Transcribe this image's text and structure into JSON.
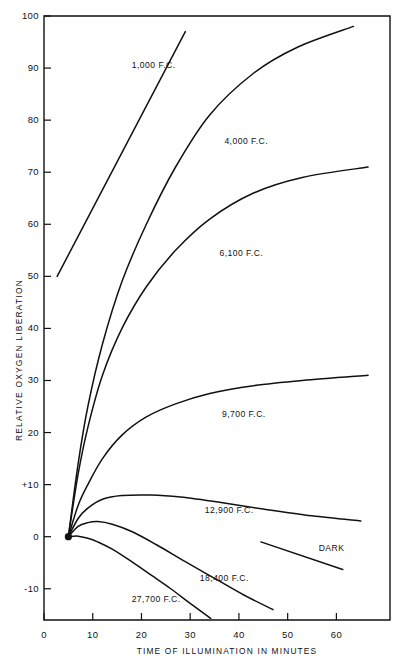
{
  "chart_data": {
    "type": "line",
    "title": "",
    "xlabel": "TIME OF ILLUMINATION IN MINUTES",
    "ylabel": "RELATIVE OXYGEN LIBERATION",
    "xlim": [
      0,
      71
    ],
    "ylim": [
      -16,
      100
    ],
    "grid": false,
    "legend": "inline-labels",
    "xticks": [
      0,
      10,
      20,
      30,
      40,
      50,
      60
    ],
    "xticklabels": [
      "0",
      "10",
      "20",
      "30",
      "40",
      "50",
      "60"
    ],
    "yticks": [
      -10,
      0,
      10,
      20,
      30,
      40,
      50,
      60,
      70,
      80,
      90,
      100
    ],
    "yticklabels": [
      "-10",
      "0",
      "+10",
      "20",
      "30",
      "40",
      "50",
      "60",
      "70",
      "80",
      "90",
      "100"
    ],
    "origin_marker": {
      "x": 5,
      "y": 0,
      "label": "origin-dot"
    },
    "series": [
      {
        "name": "1,000 F.C.",
        "label": "1,000 F.C.",
        "label_x": 22.5,
        "label_y": 90,
        "points": [
          [
            2.7,
            50
          ],
          [
            29.0,
            97
          ]
        ]
      },
      {
        "name": "4,000 F.C.",
        "label": "4,000 F.C.",
        "label_x": 41.5,
        "label_y": 75.5,
        "points": [
          [
            5,
            0
          ],
          [
            7,
            14
          ],
          [
            9,
            25
          ],
          [
            12,
            37
          ],
          [
            16,
            49
          ],
          [
            21,
            60
          ],
          [
            27,
            71
          ],
          [
            34,
            81
          ],
          [
            43,
            89
          ],
          [
            52,
            94
          ],
          [
            63.5,
            98
          ]
        ]
      },
      {
        "name": "6,100 F.C.",
        "label": "6,100 F.C.",
        "label_x": 40.5,
        "label_y": 54,
        "points": [
          [
            5,
            0
          ],
          [
            7,
            12
          ],
          [
            9,
            21
          ],
          [
            12,
            31
          ],
          [
            16,
            40
          ],
          [
            21,
            48
          ],
          [
            27,
            55
          ],
          [
            34,
            61
          ],
          [
            43,
            66
          ],
          [
            53,
            69
          ],
          [
            66.5,
            71
          ]
        ]
      },
      {
        "name": "9,700 F.C.",
        "label": "9,700 F.C.",
        "label_x": 41,
        "label_y": 23,
        "points": [
          [
            5,
            0
          ],
          [
            7,
            6
          ],
          [
            9,
            10
          ],
          [
            12,
            15
          ],
          [
            16,
            19.5
          ],
          [
            21,
            23
          ],
          [
            27,
            25.5
          ],
          [
            34,
            27.5
          ],
          [
            43,
            29
          ],
          [
            53,
            30
          ],
          [
            66.5,
            31
          ]
        ]
      },
      {
        "name": "12,900 F.C.",
        "label": "12,900 F.C.",
        "label_x": 38,
        "label_y": 4.5,
        "points": [
          [
            5,
            0
          ],
          [
            7,
            3.5
          ],
          [
            9,
            5.5
          ],
          [
            12,
            7.2
          ],
          [
            16,
            7.9
          ],
          [
            22,
            8.0
          ],
          [
            28,
            7.6
          ],
          [
            36,
            6.6
          ],
          [
            45,
            5.3
          ],
          [
            55,
            4.0
          ],
          [
            65,
            3.0
          ]
        ]
      },
      {
        "name": "DARK",
        "label": "DARK",
        "label_x": 59,
        "label_y": -2.8,
        "points": [
          [
            44.5,
            -1.0
          ],
          [
            61.3,
            -6.3
          ]
        ]
      },
      {
        "name": "18,400 F.C.",
        "label": "18,400 F.C.",
        "label_x": 37,
        "label_y": -8.5,
        "points": [
          [
            5,
            0
          ],
          [
            7,
            2.0
          ],
          [
            9,
            2.7
          ],
          [
            11,
            2.9
          ],
          [
            14,
            2.4
          ],
          [
            18,
            1.0
          ],
          [
            23,
            -1.5
          ],
          [
            29,
            -4.8
          ],
          [
            35,
            -8.0
          ],
          [
            41,
            -11.2
          ],
          [
            47,
            -14.0
          ]
        ]
      },
      {
        "name": "27,700 F.C.",
        "label": "27,700 F.C.",
        "label_x": 23,
        "label_y": -12.5,
        "points": [
          [
            5,
            0
          ],
          [
            7,
            0.1
          ],
          [
            9,
            -0.3
          ],
          [
            11,
            -1.0
          ],
          [
            14,
            -2.4
          ],
          [
            18,
            -4.8
          ],
          [
            22,
            -7.4
          ],
          [
            26,
            -10.0
          ],
          [
            30,
            -12.8
          ],
          [
            34.2,
            -15.7
          ]
        ]
      }
    ]
  }
}
